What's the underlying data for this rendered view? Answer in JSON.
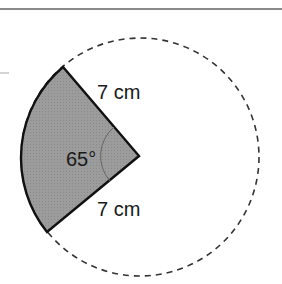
{
  "figure": {
    "type": "circle-sector",
    "sector_angle_label": "65°",
    "radius_label_top": "7 cm",
    "radius_label_bottom": "7 cm",
    "sector_fill": "#9a9a9a",
    "outline_color": "#111111",
    "dashed_circle_color": "#333333",
    "rule_color": "#8a8a8a"
  }
}
